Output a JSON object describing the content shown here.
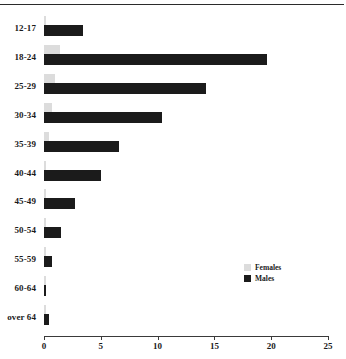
{
  "chart_data": {
    "type": "bar",
    "orientation": "horizontal",
    "title": "",
    "subtitle": "",
    "xlabel": "",
    "ylabel": "",
    "xlim": [
      0,
      25
    ],
    "xticks": [
      0,
      5,
      10,
      15,
      20,
      25
    ],
    "xtick_labels": [
      "0",
      "5",
      "10",
      "15",
      "20",
      "25"
    ],
    "grid": false,
    "legend_position": "center-right",
    "categories": [
      "12-17",
      "18-24",
      "25-29",
      "30-34",
      "35-39",
      "40-44",
      "45-49",
      "50-54",
      "55-59",
      "60-64",
      "over 64"
    ],
    "series": [
      {
        "name": "Females",
        "color": "#dcdcdc",
        "values": [
          0.2,
          1.4,
          1.0,
          0.7,
          0.4,
          0.2,
          0.2,
          0.2,
          0.2,
          0.2,
          0.2
        ]
      },
      {
        "name": "Males",
        "color": "#1b1b1b",
        "values": [
          3.4,
          19.6,
          14.3,
          10.4,
          6.6,
          5.0,
          2.7,
          1.5,
          0.7,
          0.2,
          0.4
        ]
      }
    ]
  },
  "legend": {
    "items": [
      {
        "label": "Females",
        "swatch": "female"
      },
      {
        "label": "Males",
        "swatch": "male"
      }
    ]
  },
  "colors": {
    "female": "#dcdcdc",
    "male": "#1b1b1b",
    "axis": "#3a3a3a",
    "rule": "#2b2b2b"
  }
}
